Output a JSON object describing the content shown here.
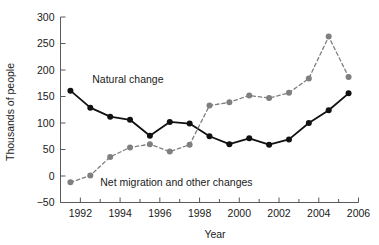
{
  "chart_data": {
    "type": "line",
    "title": "",
    "xlabel": "Year",
    "ylabel": "Thousands of people",
    "xlim": [
      1991,
      2006
    ],
    "ylim": [
      -50,
      300
    ],
    "ytick_values": [
      300,
      250,
      200,
      150,
      100,
      50,
      0,
      -50
    ],
    "ytick_labels": [
      "300",
      "250",
      "200",
      "150",
      "100",
      "50",
      "0",
      "−50"
    ],
    "xtick_values": [
      1992,
      1994,
      1996,
      1998,
      2000,
      2002,
      2004,
      2006
    ],
    "xtick_labels": [
      "1992",
      "1994",
      "1996",
      "1998",
      "2000",
      "2002",
      "2004",
      "2006"
    ],
    "x": [
      1991.5,
      1992.5,
      1993.5,
      1994.5,
      1995.5,
      1996.5,
      1997.5,
      1998.5,
      1999.5,
      2000.5,
      2001.5,
      2002.5,
      2003.5,
      2004.5,
      2005.5
    ],
    "grid": false,
    "legend_position": "inline-annotations",
    "series": [
      {
        "name": "Natural change",
        "color": "#111111",
        "linestyle": "solid",
        "marker": "circle",
        "values": [
          161,
          129,
          112,
          106,
          76,
          102,
          99,
          75,
          60,
          71,
          59,
          69,
          100,
          124,
          156
        ]
      },
      {
        "name": "Net migration and other changes",
        "color": "#7f7f7f",
        "linestyle": "dashed",
        "marker": "circle",
        "values": [
          -12,
          1,
          36,
          54,
          60,
          46,
          59,
          133,
          139,
          152,
          147,
          157,
          184,
          263,
          187
        ]
      }
    ],
    "annotations": [
      {
        "text": "Natural change",
        "x": 1992.6,
        "y": 183
      },
      {
        "text": "Net migration and other changes",
        "x": 1993.0,
        "y": -12
      }
    ]
  }
}
